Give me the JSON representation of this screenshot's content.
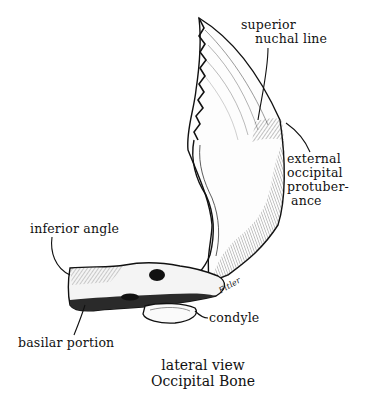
{
  "figure": {
    "caption_line1": "lateral view",
    "caption_line2": "Occipital Bone",
    "signature": "Fitler"
  },
  "labels": {
    "superior_nuchal_line_1": "superior",
    "superior_nuchal_line_2": "nuchal line",
    "external_occipital_protuberance_1": "external",
    "external_occipital_protuberance_2": "occipital",
    "external_occipital_protuberance_3": "protuber-",
    "external_occipital_protuberance_4": "ance",
    "inferior_angle": "inferior angle",
    "basilar_portion": "basilar portion",
    "condyle": "condyle"
  },
  "colors": {
    "ink": "#111111",
    "background": "#ffffff",
    "shade": "#555555"
  }
}
